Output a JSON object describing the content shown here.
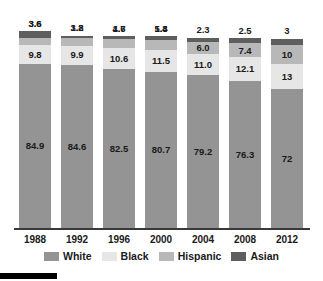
{
  "chart_data": {
    "type": "bar",
    "subtype": "stacked-bar-100",
    "title": "",
    "subtitle": "",
    "xlabel": "",
    "ylabel": "",
    "ylim": [
      0,
      100
    ],
    "grid": false,
    "legend_position": "bottom",
    "categories": [
      "1988",
      "1992",
      "1996",
      "2000",
      "2004",
      "2008",
      "2012"
    ],
    "series": [
      {
        "name": "White",
        "color": "#949494",
        "values": [
          84.9,
          84.6,
          82.5,
          80.7,
          79.2,
          76.3,
          72
        ]
      },
      {
        "name": "Black",
        "color": "#e6e6e6",
        "values": [
          9.8,
          9.9,
          10.6,
          11.5,
          11.0,
          12.1,
          13
        ]
      },
      {
        "name": "Hispanic",
        "color": "#b8b8b8",
        "values": [
          3.6,
          3.8,
          4.7,
          5.4,
          6.0,
          7.4,
          10
        ]
      },
      {
        "name": "Asian",
        "color": "#5e5e5e",
        "values": [
          3.6,
          1.2,
          1.6,
          1.8,
          2.3,
          2.5,
          3
        ]
      }
    ],
    "value_labels": {
      "White": [
        "84.9",
        "84.6",
        "82.5",
        "80.7",
        "79.2",
        "76.3",
        "72"
      ],
      "Black": [
        "9.8",
        "9.9",
        "10.6",
        "11.5",
        "11.0",
        "12.1",
        "13"
      ],
      "Hispanic": [
        "3.6",
        "3.8",
        "4.7",
        "5.4",
        "6.0",
        "7.4",
        "10"
      ],
      "Asian": [
        "3.6",
        "1.2",
        "1.6",
        "1.8",
        "2.3",
        "2.5",
        "3"
      ]
    }
  },
  "axis": {
    "ticks": [
      "1988",
      "1992",
      "1996",
      "2000",
      "2004",
      "2008",
      "2012"
    ]
  },
  "legend": {
    "items": [
      {
        "label": "White",
        "color": "#949494"
      },
      {
        "label": "Black",
        "color": "#e6e6e6"
      },
      {
        "label": "Hispanic",
        "color": "#b8b8b8"
      },
      {
        "label": "Asian",
        "color": "#5e5e5e"
      }
    ]
  },
  "colors": {
    "white_series": "#949494",
    "black_series": "#e6e6e6",
    "hispanic_series": "#b8b8b8",
    "asian_series": "#5e5e5e",
    "axis": "#3a3a3a",
    "text": "#1a1a1a",
    "background": "#ffffff",
    "footer_mark": "#000000"
  }
}
